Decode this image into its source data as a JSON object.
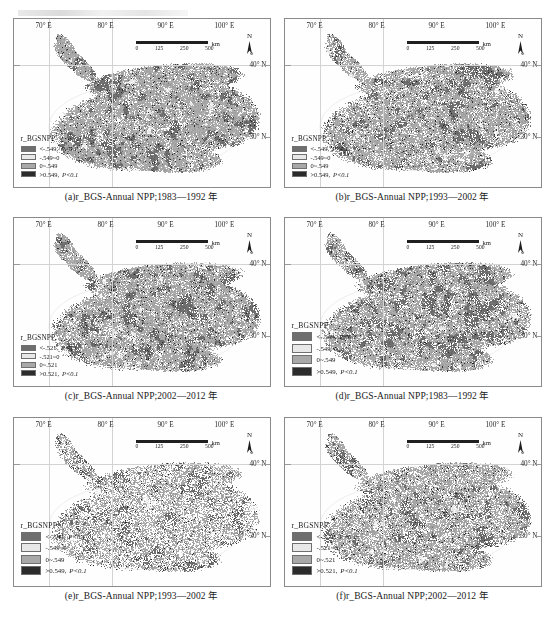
{
  "figure": {
    "axis": {
      "lon_labels": [
        "70° E",
        "80° E",
        "90° E",
        "100° E"
      ],
      "lat_labels": [
        "40° N",
        "30° N"
      ]
    },
    "scalebar": {
      "unit": "km",
      "ticks": [
        "0",
        "125",
        "250",
        "500"
      ]
    },
    "north_arrow": {
      "label": "N"
    },
    "legend_title": "r_BGSNPP",
    "legend_sets": {
      "v549": [
        {
          "swatch": "#6e6e6e",
          "label": "<-.549,",
          "sig": "P<0.1"
        },
        {
          "swatch": "#e8e8e8",
          "label": "-.549~0",
          "sig": ""
        },
        {
          "swatch": "#a8a8a8",
          "label": "0~.549",
          "sig": ""
        },
        {
          "swatch": "#2b2b2b",
          "label": ">0.549,",
          "sig": "P<0.1"
        }
      ],
      "v521": [
        {
          "swatch": "#6e6e6e",
          "label": "<-.521,",
          "sig": "P<0.1"
        },
        {
          "swatch": "#e8e8e8",
          "label": "-.521~0",
          "sig": ""
        },
        {
          "swatch": "#a8a8a8",
          "label": "0~.521",
          "sig": ""
        },
        {
          "swatch": "#2b2b2b",
          "label": ">0.521,",
          "sig": "P<0.1"
        }
      ]
    },
    "panels": [
      {
        "id": "a",
        "caption": "(a)r_BGS-Annual NPP;1983—1992 年",
        "legend_set": "v549",
        "legend_size": "small",
        "density": 0.93,
        "seed": 11
      },
      {
        "id": "b",
        "caption": "(b)r_BGS-Annual NPP;1993—2002 年",
        "legend_set": "v549",
        "legend_size": "small",
        "density": 0.88,
        "seed": 23
      },
      {
        "id": "c",
        "caption": "(c)r_BGS-Annual NPP;2002—2012 年",
        "legend_set": "v521",
        "legend_size": "small",
        "density": 0.9,
        "seed": 37
      },
      {
        "id": "d",
        "caption": "(d)r_BGS-Annual NPP;1983—1992 年",
        "legend_set": "v549",
        "legend_size": "big",
        "density": 0.86,
        "seed": 51
      },
      {
        "id": "e",
        "caption": "(e)r_BGS-Annual NPP;1993—2002 年",
        "legend_set": "v549",
        "legend_size": "big",
        "density": 0.62,
        "seed": 67
      },
      {
        "id": "f",
        "caption": "(f)r_BGS-Annual NPP;2002—2012 年",
        "legend_set": "v521",
        "legend_size": "big",
        "density": 0.8,
        "seed": 83
      }
    ]
  }
}
